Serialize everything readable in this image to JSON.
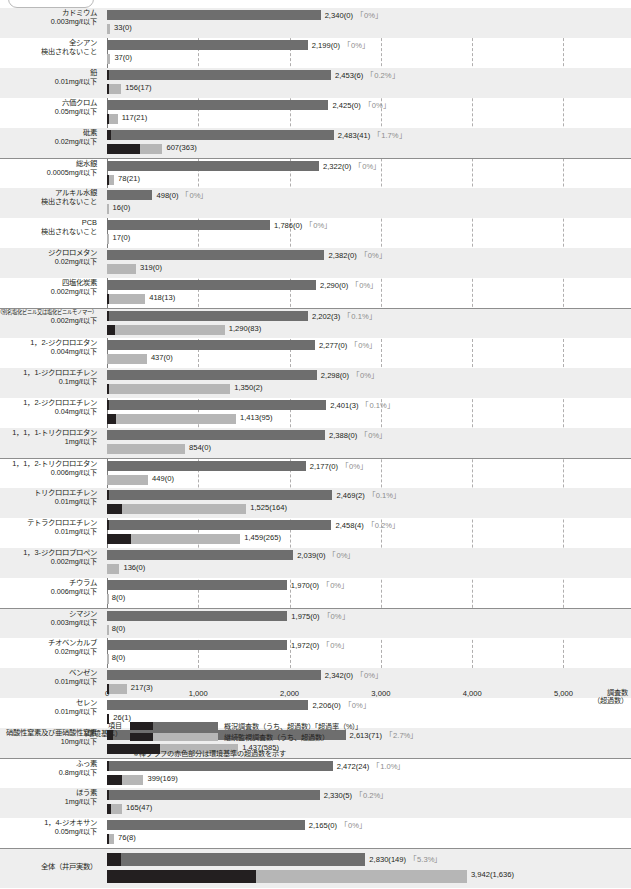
{
  "axis": {
    "ticks": [
      0,
      1000,
      2000,
      3000,
      4000,
      5000
    ],
    "tick_labels": [
      "0",
      "1,000",
      "2,000",
      "3,000",
      "4,000",
      "5,000"
    ],
    "title_line1": "調査数",
    "title_line2": "（超過数）",
    "max": 5400
  },
  "legend": {
    "item_label_line1": "項目",
    "item_label_line2": "（環境基準）",
    "series1_text": "概況調査数（うち、超過数）「超過率（%）」",
    "series2_text": "継続監視調査数（うち、超過数）",
    "note": "※棒グラフの赤色部分は環境基準の超過数を示す",
    "color_series1": "#6e6e6e",
    "color_series2": "#b6b6b6",
    "color_exceed": "#231f20"
  },
  "chart_data": {
    "type": "bar",
    "title": "",
    "xlabel": "調査数（超過数）",
    "ylabel": "項目（環境基準）",
    "xlim": [
      0,
      5400
    ],
    "grid": true,
    "legend_position": "bottom",
    "orientation": "horizontal",
    "series": [
      {
        "name": "概況調査数（うち、超過数）「超過率（%）」",
        "color": "#6e6e6e"
      },
      {
        "name": "継続監視調査数（うち、超過数）",
        "color": "#b6b6b6"
      }
    ],
    "categories": [
      {
        "name": "カドミウム",
        "standard": "0.003mg/ℓ以下",
        "survey": 2340,
        "survey_exceed": 0,
        "rate": "0%",
        "survey_label": "2,340(0)",
        "rate_label": "「0%」",
        "monitor": 33,
        "monitor_exceed": 0,
        "monitor_label": "33(0)"
      },
      {
        "name": "全シアン",
        "standard": "検出されないこと",
        "survey": 2199,
        "survey_exceed": 0,
        "rate": "0%",
        "survey_label": "2,199(0)",
        "rate_label": "「0%」",
        "monitor": 37,
        "monitor_exceed": 0,
        "monitor_label": "37(0)"
      },
      {
        "name": "鉛",
        "standard": "0.01mg/ℓ以下",
        "survey": 2453,
        "survey_exceed": 6,
        "rate": "0.2%",
        "survey_label": "2,453(6)",
        "rate_label": "「0.2%」",
        "monitor": 156,
        "monitor_exceed": 17,
        "monitor_label": "156(17)"
      },
      {
        "name": "六価クロム",
        "standard": "0.05mg/ℓ以下",
        "survey": 2425,
        "survey_exceed": 0,
        "rate": "0%",
        "survey_label": "2,425(0)",
        "rate_label": "「0%」",
        "monitor": 117,
        "monitor_exceed": 21,
        "monitor_label": "117(21)"
      },
      {
        "name": "砒素",
        "standard": "0.02mg/ℓ以下",
        "survey": 2483,
        "survey_exceed": 41,
        "rate": "1.7%",
        "survey_label": "2,483(41)",
        "rate_label": "「1.7%」",
        "monitor": 607,
        "monitor_exceed": 363,
        "monitor_label": "607(363)"
      },
      {
        "name": "総水銀",
        "standard": "0.0005mg/ℓ以下",
        "survey": 2322,
        "survey_exceed": 0,
        "rate": "0%",
        "survey_label": "2,322(0)",
        "rate_label": "「0%」",
        "monitor": 78,
        "monitor_exceed": 21,
        "monitor_label": "78(21)"
      },
      {
        "name": "アルキル水銀",
        "standard": "検出されないこと",
        "survey": 498,
        "survey_exceed": 0,
        "rate": "0%",
        "survey_label": "498(0)",
        "rate_label": "「0%」",
        "monitor": 16,
        "monitor_exceed": 0,
        "monitor_label": "16(0)"
      },
      {
        "name": "PCB",
        "standard": "検出されないこと",
        "survey": 1786,
        "survey_exceed": 0,
        "rate": "0%",
        "survey_label": "1,786(0)",
        "rate_label": "「0%」",
        "monitor": 17,
        "monitor_exceed": 0,
        "monitor_label": "17(0)"
      },
      {
        "name": "ジクロロメタン",
        "standard": "0.02mg/ℓ以下",
        "survey": 2382,
        "survey_exceed": 0,
        "rate": "0%",
        "survey_label": "2,382(0)",
        "rate_label": "「0%」",
        "monitor": 319,
        "monitor_exceed": 0,
        "monitor_label": "319(0)"
      },
      {
        "name": "四塩化炭素",
        "standard": "0.002mg/ℓ以下",
        "survey": 2290,
        "survey_exceed": 0,
        "rate": "0%",
        "survey_label": "2,290(0)",
        "rate_label": "「0%」",
        "monitor": 418,
        "monitor_exceed": 13,
        "monitor_label": "418(13)"
      },
      {
        "name": "クロロエチレン（別名塩化ビニル又は塩化ビニルモノマー）",
        "name_small": true,
        "standard": "0.002mg/ℓ以下",
        "survey": 2202,
        "survey_exceed": 3,
        "rate": "0.1%",
        "survey_label": "2,202(3)",
        "rate_label": "「0.1%」",
        "monitor": 1290,
        "monitor_exceed": 83,
        "monitor_label": "1,290(83)"
      },
      {
        "name": "1，2-ジクロロエタン",
        "standard": "0.004mg/ℓ以下",
        "survey": 2277,
        "survey_exceed": 0,
        "rate": "0%",
        "survey_label": "2,277(0)",
        "rate_label": "「0%」",
        "monitor": 437,
        "monitor_exceed": 0,
        "monitor_label": "437(0)"
      },
      {
        "name": "1，1-ジクロロエチレン",
        "standard": "0.1mg/ℓ以下",
        "survey": 2298,
        "survey_exceed": 0,
        "rate": "0%",
        "survey_label": "2,298(0)",
        "rate_label": "「0%」",
        "monitor": 1350,
        "monitor_exceed": 2,
        "monitor_label": "1,350(2)"
      },
      {
        "name": "1，2-ジクロロエチレン",
        "standard": "0.04mg/ℓ以下",
        "survey": 2401,
        "survey_exceed": 3,
        "rate": "0.1%",
        "survey_label": "2,401(3)",
        "rate_label": "「0.1%」",
        "monitor": 1413,
        "monitor_exceed": 95,
        "monitor_label": "1,413(95)"
      },
      {
        "name": "1，1，1-トリクロロエタン",
        "standard": "1mg/ℓ以下",
        "survey": 2388,
        "survey_exceed": 0,
        "rate": "0%",
        "survey_label": "2,388(0)",
        "rate_label": "「0%」",
        "monitor": 854,
        "monitor_exceed": 0,
        "monitor_label": "854(0)"
      },
      {
        "name": "1，1，2-トリクロロエタン",
        "standard": "0.006mg/ℓ以下",
        "survey": 2177,
        "survey_exceed": 0,
        "rate": "0%",
        "survey_label": "2,177(0)",
        "rate_label": "「0%」",
        "monitor": 449,
        "monitor_exceed": 0,
        "monitor_label": "449(0)"
      },
      {
        "name": "トリクロロエチレン",
        "standard": "0.01mg/ℓ以下",
        "survey": 2469,
        "survey_exceed": 2,
        "rate": "0.1%",
        "survey_label": "2,469(2)",
        "rate_label": "「0.1%」",
        "monitor": 1525,
        "monitor_exceed": 164,
        "monitor_label": "1,525(164)"
      },
      {
        "name": "テトラクロロエチレン",
        "standard": "0.01mg/ℓ以下",
        "survey": 2458,
        "survey_exceed": 4,
        "rate": "0.2%",
        "survey_label": "2,458(4)",
        "rate_label": "「0.2%」",
        "monitor": 1459,
        "monitor_exceed": 265,
        "monitor_label": "1,459(265)"
      },
      {
        "name": "1，3-ジクロロプロペン",
        "standard": "0.002mg/ℓ以下",
        "survey": 2039,
        "survey_exceed": 0,
        "rate": "0%",
        "survey_label": "2,039(0)",
        "rate_label": "「0%」",
        "monitor": 136,
        "monitor_exceed": 0,
        "monitor_label": "136(0)"
      },
      {
        "name": "チウラム",
        "standard": "0.006mg/ℓ以下",
        "survey": 1970,
        "survey_exceed": 0,
        "rate": "0%",
        "survey_label": "1,970(0)",
        "rate_label": "「0%」",
        "monitor": 8,
        "monitor_exceed": 0,
        "monitor_label": "8(0)"
      },
      {
        "name": "シマジン",
        "standard": "0.003mg/ℓ以下",
        "survey": 1975,
        "survey_exceed": 0,
        "rate": "0%",
        "survey_label": "1,975(0)",
        "rate_label": "「0%」",
        "monitor": 8,
        "monitor_exceed": 0,
        "monitor_label": "8(0)"
      },
      {
        "name": "チオベンカルブ",
        "standard": "0.02mg/ℓ以下",
        "survey": 1972,
        "survey_exceed": 0,
        "rate": "0%",
        "survey_label": "1,972(0)",
        "rate_label": "「0%」",
        "monitor": 8,
        "monitor_exceed": 0,
        "monitor_label": "8(0)"
      },
      {
        "name": "ベンゼン",
        "standard": "0.01mg/ℓ以下",
        "survey": 2342,
        "survey_exceed": 0,
        "rate": "0%",
        "survey_label": "2,342(0)",
        "rate_label": "「0%」",
        "monitor": 217,
        "monitor_exceed": 3,
        "monitor_label": "217(3)"
      },
      {
        "name": "セレン",
        "standard": "0.01mg/ℓ以下",
        "survey": 2206,
        "survey_exceed": 0,
        "rate": "0%",
        "survey_label": "2,206(0)",
        "rate_label": "「0%」",
        "monitor": 26,
        "monitor_exceed": 1,
        "monitor_label": "26(1)"
      },
      {
        "name": "硝酸性窒素及び亜硝酸性窒素",
        "standard": "10mg/ℓ以下",
        "survey": 2613,
        "survey_exceed": 71,
        "rate": "2.7%",
        "survey_label": "2,613(71)",
        "rate_label": "「2.7%」",
        "monitor": 1437,
        "monitor_exceed": 585,
        "monitor_label": "1,437(585)"
      },
      {
        "name": "ふっ素",
        "standard": "0.8mg/ℓ以下",
        "survey": 2472,
        "survey_exceed": 24,
        "rate": "1.0%",
        "survey_label": "2,472(24)",
        "rate_label": "「1.0%」",
        "monitor": 399,
        "monitor_exceed": 169,
        "monitor_label": "399(169)"
      },
      {
        "name": "ほう素",
        "standard": "1mg/ℓ以下",
        "survey": 2330,
        "survey_exceed": 5,
        "rate": "0.2%",
        "survey_label": "2,330(5)",
        "rate_label": "「0.2%」",
        "monitor": 165,
        "monitor_exceed": 47,
        "monitor_label": "165(47)"
      },
      {
        "name": "1，4-ジオキサン",
        "standard": "0.05mg/ℓ以下",
        "survey": 2165,
        "survey_exceed": 0,
        "rate": "0%",
        "survey_label": "2,165(0)",
        "rate_label": "「0%」",
        "monitor": 76,
        "monitor_exceed": 8,
        "monitor_label": "76(8)"
      },
      {
        "name": "全体（井戸実数）",
        "standard": "",
        "survey": 2830,
        "survey_exceed": 149,
        "rate": "5.3%",
        "survey_label": "2,830(149)",
        "rate_label": "「5.3%」",
        "monitor": 3942,
        "monitor_exceed": 1636,
        "monitor_label": "3,942(1,636)",
        "is_total": true
      }
    ]
  }
}
